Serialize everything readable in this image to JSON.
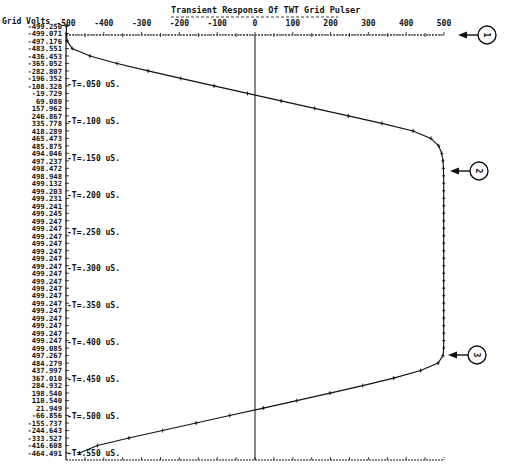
{
  "chart_data": {
    "type": "line",
    "title": "Transient Response Of TWT Grid Pulser",
    "ylabel": "Grid Volts",
    "xlabel": "",
    "x_axis": {
      "ticks": [
        -500,
        -400,
        -300,
        -200,
        -100,
        0,
        100,
        200,
        300,
        400,
        500
      ],
      "range": [
        -500,
        500
      ],
      "position": "top"
    },
    "time_axis": {
      "labels": [
        "T=.050 uS.",
        "T=.100 uS.",
        "T=.150 uS.",
        "T=.200 uS.",
        "T=.250 uS.",
        "T=.300 uS.",
        "T=.350 uS.",
        "T=.400 uS.",
        "T=.450 uS.",
        "T=.500 uS.",
        "T=.550 uS."
      ],
      "times_us": [
        0.05,
        0.1,
        0.15,
        0.2,
        0.25,
        0.3,
        0.35,
        0.4,
        0.45,
        0.5,
        0.55
      ]
    },
    "grid": false,
    "series": [
      {
        "name": "Grid Volts",
        "values": [
          "-499.250",
          "-499.071",
          "-497.176",
          "-483.551",
          "-436.453",
          "-365.052",
          "-282.807",
          "-196.352",
          "-108.328",
          "-19.729",
          "69.080",
          "157.962",
          "246.867",
          "335.778",
          "418.289",
          "465.473",
          "485.875",
          "494.046",
          "497.237",
          "498.472",
          "498.948",
          "499.132",
          "499.203",
          "499.231",
          "499.241",
          "499.245",
          "499.247",
          "499.247",
          "499.247",
          "499.247",
          "499.247",
          "499.247",
          "499.247",
          "499.247",
          "499.247",
          "499.247",
          "499.247",
          "499.247",
          "499.247",
          "499.247",
          "499.247",
          "499.247",
          "499.247",
          "499.085",
          "497.267",
          "484.279",
          "437.997",
          "367.010",
          "284.932",
          "198.540",
          "110.540",
          "21.949",
          "-66.856",
          "-155.737",
          "-244.643",
          "-333.527",
          "-416.608",
          "-464.491"
        ]
      }
    ],
    "annotations": [
      {
        "label": "1",
        "target": "x-axis top (500 V)"
      },
      {
        "label": "2",
        "target": "rising edge settling near +500 V"
      },
      {
        "label": "3",
        "target": "start of falling edge near +500 V"
      }
    ]
  }
}
